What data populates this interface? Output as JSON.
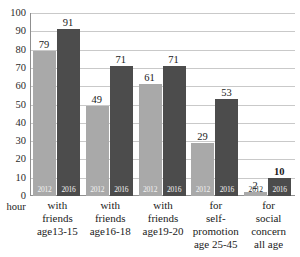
{
  "chart_data": {
    "type": "bar",
    "title": "",
    "xlabel": "hour",
    "ylabel": "",
    "ylim": [
      0,
      100
    ],
    "ystep": 10,
    "grid": true,
    "legend_position": "in-bar",
    "categories": [
      "with friends age13-15",
      "with friends age16-18",
      "with friends age19-20",
      "for self-promotion age 25-45",
      "for social concern all age"
    ],
    "category_lines": [
      [
        "with",
        "friends",
        "age13-15"
      ],
      [
        "with",
        "friends",
        "age16-18"
      ],
      [
        "with",
        "friends",
        "age19-20"
      ],
      [
        "for",
        "self-",
        "promotion",
        "age 25-45"
      ],
      [
        "for",
        "social",
        "concern",
        "all age"
      ]
    ],
    "ytick_labels": [
      "100",
      "90",
      "80",
      "70",
      "60",
      "50",
      "40",
      "30",
      "20",
      "10",
      "0"
    ],
    "series": [
      {
        "name": "2012",
        "color": "#a9a9a9",
        "values": [
          79,
          49,
          61,
          29,
          2
        ]
      },
      {
        "name": "2016",
        "color": "#4c4c4c",
        "values": [
          91,
          71,
          71,
          53,
          10
        ]
      }
    ],
    "value_labels": {
      "s2012": [
        "79",
        "49",
        "61",
        "29",
        "2"
      ],
      "s2016": [
        "91",
        "71",
        "71",
        "53",
        "10"
      ]
    },
    "bold_labels": [
      "10"
    ],
    "colors": {
      "series_2012": "#a9a9a9",
      "series_2016": "#4c4c4c",
      "gridline": "#c9c9c9",
      "axis": "#8f8f8f",
      "text": "#1a1a1a",
      "background": "#ffffff"
    }
  }
}
